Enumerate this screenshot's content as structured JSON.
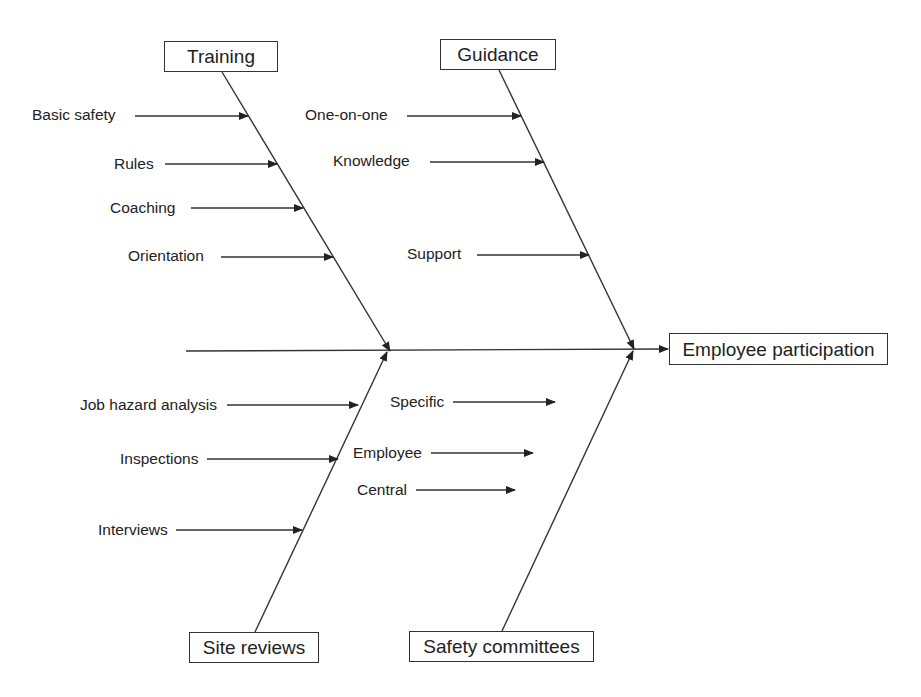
{
  "diagram": {
    "type": "fishbone",
    "effect": "Employee participation",
    "categories": [
      {
        "name": "Training",
        "position": "top",
        "causes": [
          "Basic safety",
          "Rules",
          "Coaching",
          "Orientation"
        ]
      },
      {
        "name": "Guidance",
        "position": "top",
        "causes": [
          "One-on-one",
          "Knowledge",
          "Support"
        ]
      },
      {
        "name": "Site reviews",
        "position": "bottom",
        "causes": [
          "Job hazard analysis",
          "Inspections",
          "Interviews"
        ]
      },
      {
        "name": "Safety committees",
        "position": "bottom",
        "causes": [
          "Specific",
          "Employee",
          "Central"
        ]
      }
    ]
  }
}
